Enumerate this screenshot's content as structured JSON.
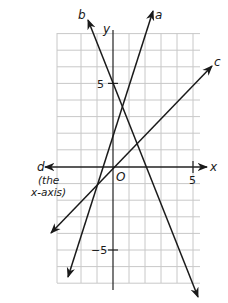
{
  "diagram": {
    "axes": {
      "x_label": "x",
      "y_label": "y",
      "origin_label": "O",
      "x_tick_label": "5",
      "y_tick_pos_label": "5",
      "y_tick_neg_label": "−5"
    },
    "lines": [
      {
        "id": "a",
        "label": "a"
      },
      {
        "id": "b",
        "label": "b"
      },
      {
        "id": "c",
        "label": "c"
      },
      {
        "id": "d",
        "label": "d",
        "note_line1": "(the",
        "note_line2": "x-axis)"
      }
    ],
    "colors": {
      "grid": "#c8c8c8",
      "ink": "#1a1a1a",
      "background": "#ffffff"
    }
  }
}
